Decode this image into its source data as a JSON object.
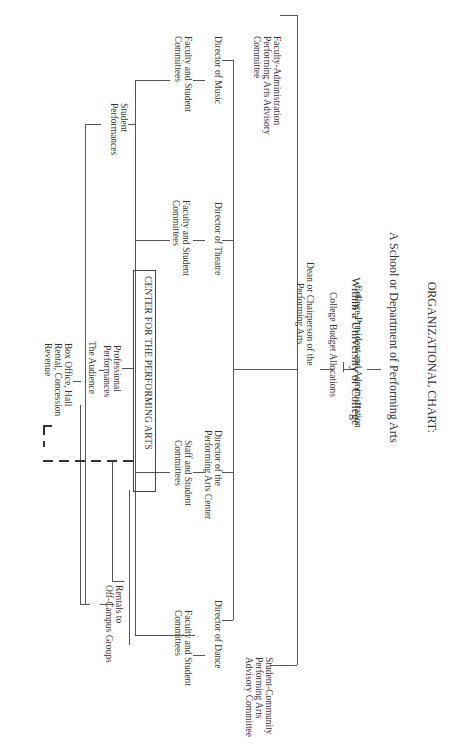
{
  "title": {
    "line1": "ORGANIZATIONAL CHART:",
    "line2": "A School or Department of Performing Arts",
    "line3": "Within a University or College"
  },
  "nodes": {
    "president": "College President and Administration",
    "budget": "College Budget Allocations",
    "dean": "Dean or Chairperson of the\nPerforming Arts",
    "faculty_admin_committee": "Faculty-Administration\nPerforming Arts Advisory\nCommittee",
    "student_community_committee": "Student-Community\nPerforming Arts\nAdvisory Committee",
    "director_music": "Director of Music",
    "music_committees": "Faculty and Student\nCommittees",
    "director_theatre": "Director of Theatre",
    "theatre_committees": "Faculty and Student\nCommittees",
    "director_pac": "Director of the\nPerforming Arts Center",
    "pac_committees": "Staff and Student\nCommittees",
    "director_dance": "Director of Dance",
    "dance_committees": "Faculty and Student\nCommittees",
    "student_performances": "Student\nPerformances",
    "center": "CENTER FOR THE PERFORMING ARTS",
    "professional_performances": "Professional\nPerformances",
    "audience": "The Audience",
    "revenue": "Box Office, Hall\nRental, Concession\nRevenue",
    "rentals": "Rentals to\nOff-Campus Groups"
  }
}
